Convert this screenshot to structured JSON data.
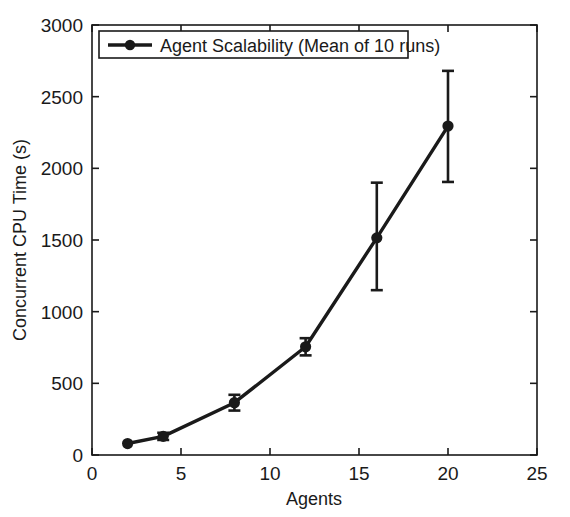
{
  "chart_data": {
    "type": "line",
    "title": "",
    "subtitle": "",
    "xlabel": "Agents",
    "ylabel": "Concurrent CPU Time (s)",
    "xlim": [
      0,
      25
    ],
    "ylim": [
      0,
      3000
    ],
    "xticks": [
      0,
      5,
      10,
      15,
      20,
      25
    ],
    "yticks": [
      0,
      500,
      1000,
      1500,
      2000,
      2500,
      3000
    ],
    "xtick_labels": [
      "0",
      "5",
      "10",
      "15",
      "20",
      "25"
    ],
    "ytick_labels": [
      "0",
      "500",
      "1000",
      "1500",
      "2000",
      "2500",
      "3000"
    ],
    "grid": false,
    "legend_position": "upper-left-inside",
    "legend_entries": [
      "Agent Scalability (Mean of 10 runs)"
    ],
    "marker": "circle",
    "line_color": "#1a1a1a",
    "marker_color": "#1a1a1a",
    "error_bars": true,
    "x": [
      2,
      4,
      8,
      12,
      16,
      20
    ],
    "series": [
      {
        "name": "Agent Scalability (Mean of 10 runs)",
        "values": [
          80,
          130,
          365,
          755,
          1515,
          2295
        ],
        "error_low": [
          0,
          25,
          55,
          60,
          365,
          390
        ],
        "error_high": [
          0,
          25,
          55,
          60,
          385,
          385
        ]
      }
    ],
    "points": [
      {
        "x": 2,
        "y": 80,
        "err_lo": 0,
        "err_hi": 0
      },
      {
        "x": 4,
        "y": 130,
        "err_lo": 25,
        "err_hi": 25
      },
      {
        "x": 8,
        "y": 365,
        "err_lo": 55,
        "err_hi": 55
      },
      {
        "x": 12,
        "y": 755,
        "err_lo": 60,
        "err_hi": 60
      },
      {
        "x": 16,
        "y": 1515,
        "err_lo": 365,
        "err_hi": 385
      },
      {
        "x": 20,
        "y": 2295,
        "err_lo": 390,
        "err_hi": 385
      }
    ]
  },
  "axes": {
    "x_title": "Agents",
    "y_title": "Concurrent CPU Time (s)"
  },
  "legend": {
    "entry_label": "Agent Scalability (Mean of 10 runs)"
  },
  "colors": {
    "foreground": "#1a1a1a",
    "background": "#ffffff",
    "series": "#1a1a1a"
  }
}
